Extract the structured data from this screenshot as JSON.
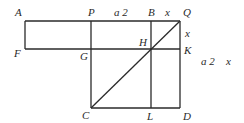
{
  "diagram": {
    "points": {
      "A": {
        "label": "A",
        "x": 25,
        "y": 21
      },
      "P": {
        "label": "P",
        "x": 91,
        "y": 21
      },
      "B": {
        "label": "B",
        "x": 151,
        "y": 21
      },
      "Q": {
        "label": "Q",
        "x": 180,
        "y": 21
      },
      "F": {
        "label": "F",
        "x": 25,
        "y": 49
      },
      "G": {
        "label": "G",
        "x": 91,
        "y": 49
      },
      "H": {
        "label": "H",
        "x": 151,
        "y": 49
      },
      "K": {
        "label": "K",
        "x": 180,
        "y": 49
      },
      "C": {
        "label": "C",
        "x": 91,
        "y": 108
      },
      "L": {
        "label": "L",
        "x": 151,
        "y": 108
      },
      "D": {
        "label": "D",
        "x": 180,
        "y": 108
      }
    },
    "segments": [
      [
        "A",
        "Q"
      ],
      [
        "F",
        "K"
      ],
      [
        "C",
        "D"
      ],
      [
        "A",
        "F"
      ],
      [
        "P",
        "C"
      ],
      [
        "B",
        "L"
      ],
      [
        "Q",
        "D"
      ],
      [
        "Q",
        "C"
      ]
    ],
    "annotations": {
      "PB_length": "a 2",
      "BQ_length": "x",
      "QK_length": "x",
      "side_label_a2": "a 2",
      "side_label_x": "x"
    }
  }
}
